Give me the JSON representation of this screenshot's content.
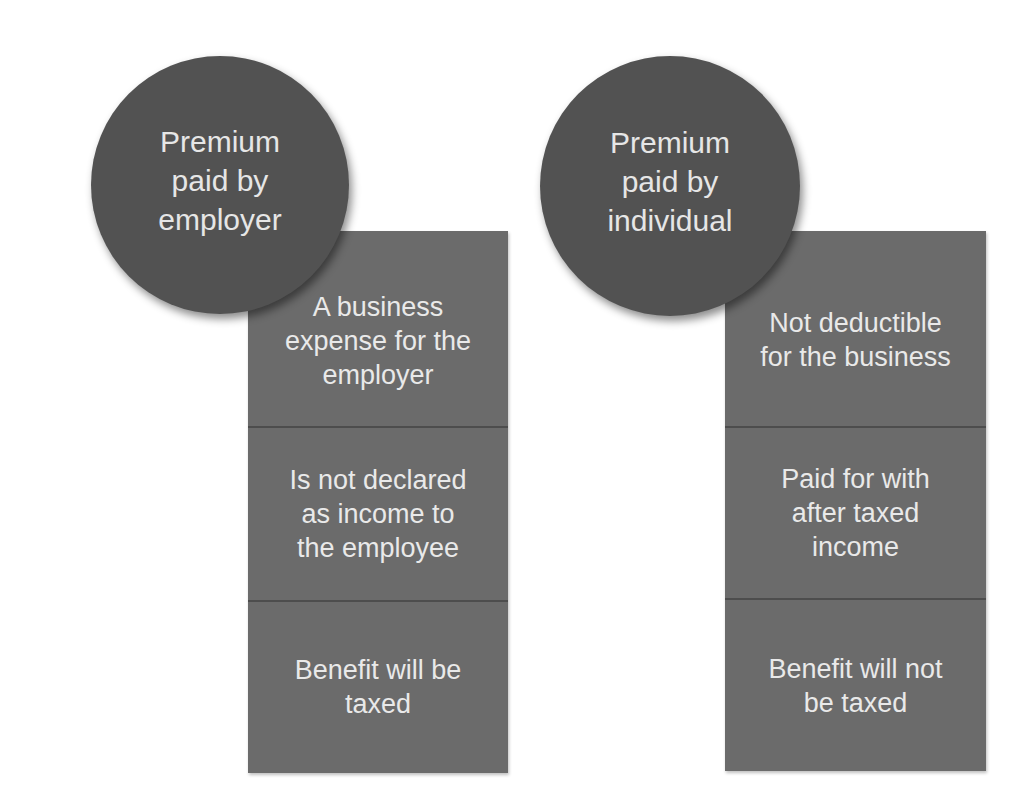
{
  "colors": {
    "circle_fill": "#525252",
    "box_fill": "#6b6b6b",
    "divider": "#4d4d4d",
    "text": "#e9e9e9",
    "background": "#ffffff"
  },
  "columns": [
    {
      "circle": {
        "lines": [
          "Premium",
          "paid by",
          "employer"
        ]
      },
      "boxes": [
        {
          "lines": [
            "A business",
            "expense for the",
            "employer"
          ]
        },
        {
          "lines": [
            "Is not declared",
            "as income to",
            "the employee"
          ]
        },
        {
          "lines": [
            "Benefit will be",
            "taxed"
          ]
        }
      ]
    },
    {
      "circle": {
        "lines": [
          "Premium",
          "paid by",
          "individual"
        ]
      },
      "boxes": [
        {
          "lines": [
            "Not deductible",
            "for the business"
          ]
        },
        {
          "lines": [
            "Paid for with",
            "after taxed",
            "income"
          ]
        },
        {
          "lines": [
            "Benefit will not",
            "be taxed"
          ]
        }
      ]
    }
  ]
}
